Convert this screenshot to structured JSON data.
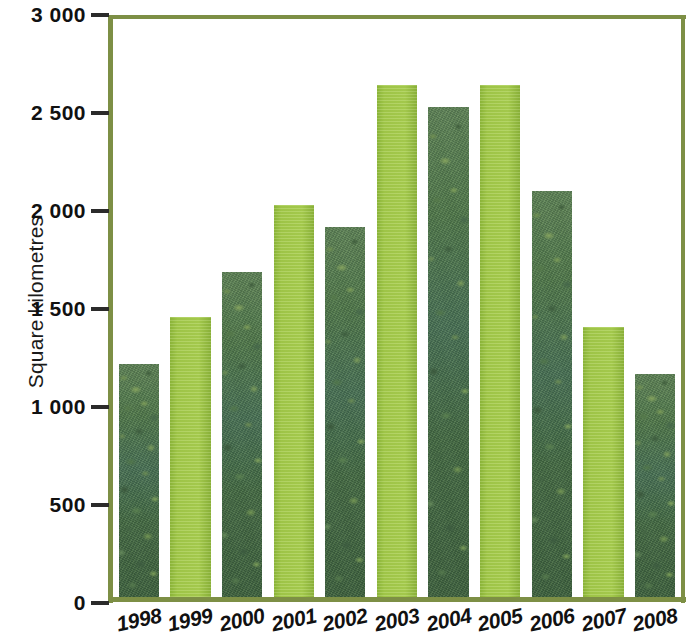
{
  "chart_data": {
    "type": "bar",
    "title": "",
    "subtitle": "",
    "xlabel": "",
    "ylabel": "Square kilometres",
    "categories": [
      "1998",
      "1999",
      "2000",
      "2001",
      "2002",
      "2003",
      "2004",
      "2005",
      "2006",
      "2007",
      "2008"
    ],
    "values": [
      1190,
      1430,
      1660,
      2000,
      1890,
      2610,
      2500,
      2610,
      2070,
      1380,
      1140
    ],
    "ylim": [
      0,
      3000
    ],
    "y_ticks": [
      0,
      500,
      1000,
      1500,
      2000,
      2500,
      3000
    ],
    "y_tick_labels": [
      "0",
      "500",
      "1 000",
      "1 500",
      "2 000",
      "2 500",
      "3 000"
    ],
    "grid": false,
    "legend": false,
    "legend_position": "none",
    "bar_fills": [
      "photo",
      "solid",
      "photo",
      "solid",
      "photo",
      "solid",
      "photo",
      "solid",
      "photo",
      "solid",
      "photo"
    ],
    "series": [
      {
        "name": "Square kilometres",
        "values": [
          1190,
          1430,
          1660,
          2000,
          1890,
          2610,
          2500,
          2610,
          2070,
          1380,
          1140
        ]
      }
    ]
  },
  "colors": {
    "bar_solid_green": "#a3ca49",
    "bar_photo_green": "#4c6b42",
    "axis_olive": "#7d8f45",
    "tick_text": "#111111",
    "background": "#ffffff"
  },
  "axis": {
    "y_title": "Square kilometres"
  }
}
